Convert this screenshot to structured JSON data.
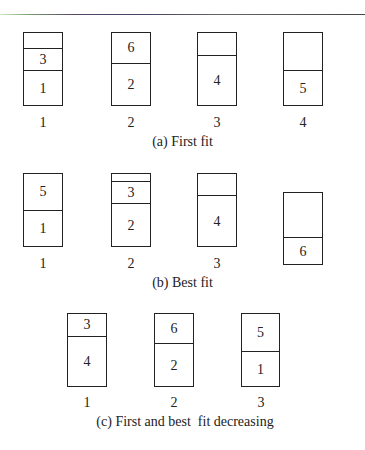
{
  "diagram": {
    "rows": [
      {
        "caption": "(a) First fit",
        "bins": [
          {
            "label": "1",
            "items": [
              {
                "text": ""
              },
              {
                "text": "3"
              },
              {
                "text": "1"
              }
            ]
          },
          {
            "label": "2",
            "items": [
              {
                "text": "6"
              },
              {
                "text": "2"
              }
            ]
          },
          {
            "label": "3",
            "items": [
              {
                "text": ""
              },
              {
                "text": "4"
              }
            ]
          },
          {
            "label": "4",
            "items": [
              {
                "text": ""
              },
              {
                "text": "5"
              }
            ]
          }
        ]
      },
      {
        "caption": "(b) Best fit",
        "bins": [
          {
            "label": "1",
            "items": [
              {
                "text": "5"
              },
              {
                "text": "1"
              }
            ]
          },
          {
            "label": "2",
            "items": [
              {
                "text": ""
              },
              {
                "text": "3"
              },
              {
                "text": "2"
              }
            ]
          },
          {
            "label": "3",
            "items": [
              {
                "text": ""
              },
              {
                "text": "4"
              }
            ]
          },
          {
            "label": "",
            "items": [
              {
                "text": ""
              },
              {
                "text": "6"
              }
            ]
          }
        ]
      },
      {
        "caption": "(c) First and best  fit decreasing",
        "bins": [
          {
            "label": "1",
            "items": [
              {
                "text": "3"
              },
              {
                "text": "4"
              }
            ]
          },
          {
            "label": "2",
            "items": [
              {
                "text": "6"
              },
              {
                "text": "2"
              }
            ]
          },
          {
            "label": "3",
            "items": [
              {
                "text": "5"
              },
              {
                "text": "1"
              }
            ]
          }
        ]
      }
    ]
  }
}
